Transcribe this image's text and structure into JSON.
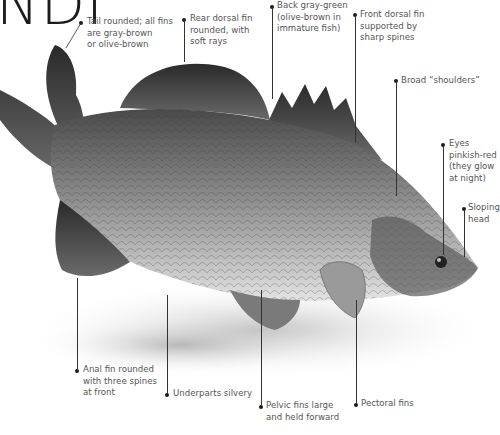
{
  "title": {
    "fragment": "NDI"
  },
  "fish": {
    "subject": "barramundi-illustration"
  },
  "annotations": [
    {
      "id": "tail",
      "lines": [
        "Tail rounded; all fins",
        "are gray-brown",
        "or olive-brown"
      ]
    },
    {
      "id": "rear-dorsal",
      "lines": [
        "Rear dorsal fin",
        "rounded, with",
        "soft rays"
      ]
    },
    {
      "id": "back",
      "lines": [
        "Back gray-green",
        "(olive-brown in",
        "immature fish)"
      ]
    },
    {
      "id": "front-dorsal",
      "lines": [
        "Front dorsal fin",
        "supported by",
        "sharp spines"
      ]
    },
    {
      "id": "shoulders",
      "lines": [
        "Broad “shoulders”"
      ]
    },
    {
      "id": "eyes",
      "lines": [
        "Eyes",
        "pinkish-red",
        "(they glow",
        "at night)"
      ]
    },
    {
      "id": "head",
      "lines": [
        "Sloping",
        "head"
      ]
    },
    {
      "id": "anal-fin",
      "lines": [
        "Anal fin rounded",
        "with three spines",
        "at front"
      ]
    },
    {
      "id": "underparts",
      "lines": [
        "Underparts silvery"
      ]
    },
    {
      "id": "pelvic",
      "lines": [
        "Pelvic fins large",
        "and held forward"
      ]
    },
    {
      "id": "pectoral",
      "lines": [
        "Pectoral fins"
      ]
    }
  ],
  "colors": {
    "text": "#555555",
    "leader": "#333333",
    "title": "#1c1c1c"
  }
}
